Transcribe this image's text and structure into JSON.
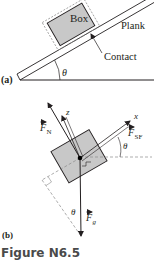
{
  "figure": {
    "caption": "Figure N6.5",
    "colors": {
      "ink": "#231f20",
      "box_fill": "#c8c8c8",
      "caption": "#4a4a4a",
      "dashed": "#8a8a8a",
      "background": "#ffffff"
    }
  },
  "panel_a": {
    "label": "(a)",
    "box_label": "Box",
    "plank_label": "Plank",
    "contact_label": "Contact",
    "angle_label": "θ",
    "incline_angle_deg": 30
  },
  "panel_b": {
    "label": "(b)",
    "axis_x_label": "x",
    "axis_z_label": "z",
    "force_normal": {
      "symbol": "F",
      "subscript": "N"
    },
    "force_static_friction": {
      "symbol": "F",
      "subscript": "SF"
    },
    "force_gravity": {
      "symbol": "F",
      "subscript": "g"
    },
    "angle_label_upper": "θ",
    "angle_label_lower": "θ"
  }
}
